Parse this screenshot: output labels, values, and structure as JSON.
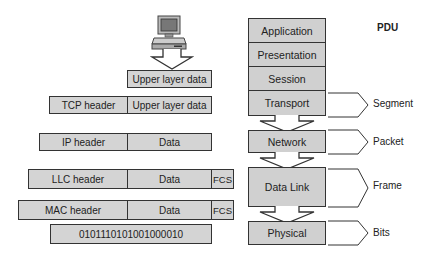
{
  "diagram": {
    "title": "PDU",
    "encapsulation": {
      "rows": [
        {
          "cells": [
            "Upper layer data"
          ]
        },
        {
          "cells": [
            "TCP header",
            "Upper layer data"
          ]
        },
        {
          "cells": [
            "IP header",
            "Data"
          ]
        },
        {
          "cells": [
            "LLC header",
            "Data",
            "FCS"
          ]
        },
        {
          "cells": [
            "MAC header",
            "Data",
            "FCS"
          ]
        },
        {
          "cells": [
            "0101110101001000010"
          ]
        }
      ]
    },
    "osi_layers": [
      "Application",
      "Presentation",
      "Session",
      "Transport",
      "Network",
      "Data Link",
      "Physical"
    ],
    "pdus": [
      {
        "layer": "Transport",
        "label": "Segment"
      },
      {
        "layer": "Network",
        "label": "Packet"
      },
      {
        "layer": "Data Link",
        "label": "Frame"
      },
      {
        "layer": "Physical",
        "label": "Bits"
      }
    ],
    "icons": {
      "computer": "computer-icon",
      "arrow": "down-arrow-icon",
      "bracket": "bracket-icon"
    },
    "colors": {
      "box_fill": "#d4d4d4",
      "border": "#333333",
      "background": "#ffffff"
    }
  }
}
